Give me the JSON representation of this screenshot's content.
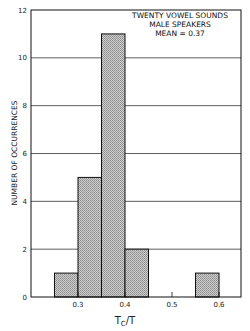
{
  "chart_data": {
    "type": "bar",
    "title": "",
    "annotation": [
      "TWENTY VOWEL SOUNDS",
      "MALE SPEAKERS",
      "MEAN = 0.37"
    ],
    "xlabel": "Tc/T",
    "ylabel": "NUMBER OF OCCURRENCES",
    "xlim": [
      0.2,
      0.65
    ],
    "ylim": [
      0,
      12
    ],
    "xticks": [
      0.3,
      0.4,
      0.5,
      0.6
    ],
    "xtick_labels": [
      "0.3",
      "0.4",
      "0.5",
      "0.6"
    ],
    "yticks": [
      0,
      2,
      4,
      6,
      8,
      10,
      12
    ],
    "ytick_labels": [
      "0",
      "2",
      "4",
      "6",
      "8",
      "10",
      "12"
    ],
    "grid": "horizontal",
    "bins": [
      {
        "x0": 0.25,
        "x1": 0.3,
        "count": 1
      },
      {
        "x0": 0.3,
        "x1": 0.35,
        "count": 5
      },
      {
        "x0": 0.35,
        "x1": 0.4,
        "count": 11
      },
      {
        "x0": 0.4,
        "x1": 0.45,
        "count": 2
      },
      {
        "x0": 0.55,
        "x1": 0.6,
        "count": 1
      }
    ],
    "categories": [
      "0.25-0.30",
      "0.30-0.35",
      "0.35-0.40",
      "0.40-0.45",
      "0.55-0.60"
    ],
    "values": [
      1,
      5,
      11,
      2,
      1
    ],
    "colors": {
      "bar_fill": "#bdbdbd",
      "bar_edge": "#111111",
      "axis": "#111111",
      "grid": "#333333"
    }
  },
  "labels": {
    "annotation_line1": "TWENTY VOWEL SOUNDS",
    "annotation_line2": "MALE SPEAKERS",
    "annotation_line3": "MEAN = 0.37",
    "ylabel": "NUMBER OF OCCURRENCES",
    "xlabel_main": "T",
    "xlabel_sub": "C",
    "xlabel_rest": "/T"
  }
}
